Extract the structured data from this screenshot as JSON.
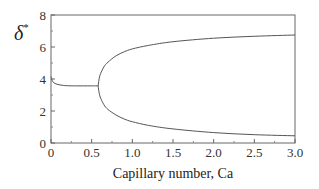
{
  "chart_data": {
    "type": "line",
    "title": "",
    "xlabel": "Capillary number, Ca",
    "ylabel": "δ",
    "ylabel_superscript": "*",
    "xlim": [
      0,
      3.0
    ],
    "ylim": [
      0,
      8
    ],
    "xticks": [
      0,
      0.5,
      1.0,
      1.5,
      2.0,
      2.5,
      3.0
    ],
    "xtick_labels": [
      "0",
      "0.5",
      "1.0",
      "1.5",
      "2.0",
      "2.5",
      "3.0"
    ],
    "yticks": [
      0,
      2,
      4,
      6,
      8
    ],
    "ytick_labels": [
      "0",
      "2",
      "4",
      "6",
      "8"
    ],
    "grid": false,
    "legend": null,
    "line_color": "#555555",
    "series": [
      {
        "name": "single branch",
        "x": [
          0.0,
          0.02,
          0.05,
          0.1,
          0.15,
          0.2,
          0.3,
          0.4,
          0.5,
          0.58
        ],
        "y": [
          4.15,
          3.85,
          3.72,
          3.64,
          3.6,
          3.58,
          3.57,
          3.57,
          3.57,
          3.57
        ]
      },
      {
        "name": "upper branch",
        "x": [
          0.58,
          0.6,
          0.65,
          0.7,
          0.8,
          0.9,
          1.0,
          1.2,
          1.5,
          2.0,
          2.5,
          3.0
        ],
        "y": [
          3.57,
          4.2,
          4.75,
          5.05,
          5.45,
          5.7,
          5.88,
          6.1,
          6.33,
          6.55,
          6.67,
          6.75
        ]
      },
      {
        "name": "lower branch",
        "x": [
          0.58,
          0.6,
          0.65,
          0.7,
          0.8,
          0.9,
          1.0,
          1.2,
          1.5,
          2.0,
          2.5,
          3.0
        ],
        "y": [
          3.57,
          2.95,
          2.4,
          2.1,
          1.75,
          1.5,
          1.33,
          1.1,
          0.88,
          0.65,
          0.52,
          0.45
        ]
      }
    ]
  }
}
